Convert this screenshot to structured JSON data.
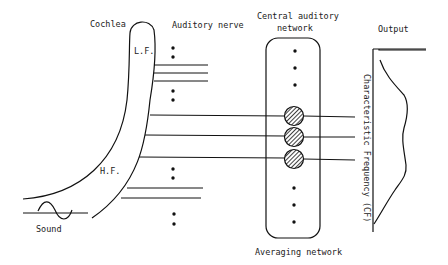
{
  "labels": {
    "cochlea": "Cochlea",
    "auditory_nerve": "Auditory nerve",
    "central_line1": "Central auditory",
    "central_line2": "network",
    "output": "Output",
    "lf": "L.F.",
    "hf": "H.F.",
    "sound": "Sound",
    "averaging": "Averaging network",
    "cf_axis": "Characteristic Frequency (CF)"
  },
  "colors": {
    "stroke": "#111111",
    "text": "#222222",
    "background": "#ffffff"
  },
  "nodes": {
    "hatched_units": 3,
    "dots_above": 3,
    "dots_below": 3
  }
}
